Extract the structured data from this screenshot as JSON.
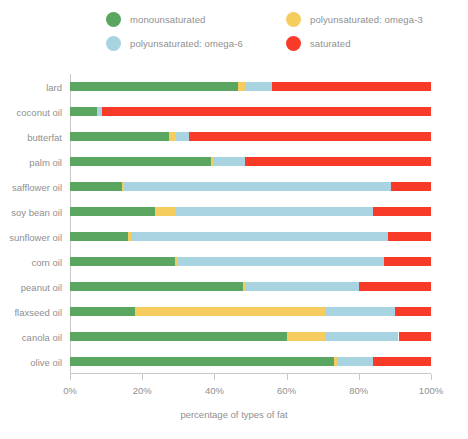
{
  "chart_data": {
    "type": "bar",
    "orientation": "horizontal",
    "stacked": true,
    "stack_mode": "percent",
    "title": "",
    "xlabel": "percentage of types of fat",
    "ylabel": "",
    "xlim": [
      0,
      100
    ],
    "xticks": [
      0,
      20,
      40,
      60,
      80,
      100
    ],
    "xtick_labels": [
      "0%",
      "20%",
      "40%",
      "60%",
      "80%",
      "100%"
    ],
    "grid": false,
    "legend_position": "top",
    "categories": [
      "lard",
      "coconut oil",
      "butterfat",
      "palm oil",
      "safflower oil",
      "soy bean oil",
      "sunflower oil",
      "corn oil",
      "peanut oil",
      "flaxseed oil",
      "canola oil",
      "olive oil"
    ],
    "series": [
      {
        "name": "monounsaturated",
        "color": "#5aa55f",
        "values": [
          46.5,
          7.5,
          27.5,
          39.0,
          14.5,
          23.5,
          16.0,
          29.0,
          48.0,
          18.0,
          60.0,
          73.0
        ]
      },
      {
        "name": "polyunsaturated: omega-3",
        "color": "#f5cd5f",
        "values": [
          2.0,
          0.0,
          2.0,
          0.5,
          0.5,
          6.0,
          1.0,
          1.0,
          0.5,
          53.0,
          11.0,
          1.0
        ]
      },
      {
        "name": "polyunsaturated: omega-6",
        "color": "#a8d3e0",
        "values": [
          7.5,
          1.5,
          3.5,
          9.0,
          74.0,
          54.5,
          71.0,
          57.0,
          31.5,
          19.0,
          20.0,
          10.0
        ]
      },
      {
        "name": "saturated",
        "color": "#f83a29",
        "values": [
          44.0,
          91.0,
          67.0,
          51.5,
          11.0,
          16.0,
          12.0,
          13.0,
          20.0,
          10.0,
          9.0,
          16.0
        ]
      }
    ]
  },
  "legend": {
    "items": [
      {
        "label": "monounsaturated",
        "color": "#5aa55f"
      },
      {
        "label": "polyunsaturated: omega-3",
        "color": "#f5cd5f"
      },
      {
        "label": "polyunsaturated: omega-6",
        "color": "#a8d3e0"
      },
      {
        "label": "saturated",
        "color": "#f83a29"
      }
    ]
  },
  "axes": {
    "x_title": "percentage of types of fat",
    "x_tick_labels": [
      "0%",
      "20%",
      "40%",
      "60%",
      "80%",
      "100%"
    ]
  },
  "colors": {
    "monounsaturated": "#5aa55f",
    "omega3": "#f5cd5f",
    "omega6": "#a8d3e0",
    "saturated": "#f83a29",
    "axis": "#c8c8c8",
    "text": "#8f8f8f",
    "background": "#ffffff"
  }
}
